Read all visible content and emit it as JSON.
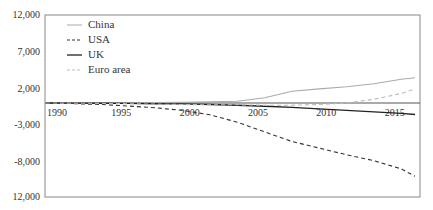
{
  "chart_data": {
    "type": "line",
    "title": "",
    "xlabel": "",
    "ylabel": "",
    "ylim": [
      -12000,
      12000
    ],
    "xlim": [
      1990,
      2017
    ],
    "y_ticks": [
      12000,
      7000,
      2000,
      -3000,
      -8000,
      -12000
    ],
    "y_tick_labels": [
      "12,000",
      "7,000",
      "2,000",
      "-3,000",
      "-8,000",
      "12,000"
    ],
    "x_ticks": [
      1990,
      1995,
      2000,
      2005,
      2010,
      2015
    ],
    "x_tick_labels": [
      "1990",
      "1995",
      "2000",
      "2005",
      "2010",
      "2015"
    ],
    "grid": false,
    "legend_position": "upper-left",
    "x": [
      1990,
      1992,
      1994,
      1996,
      1998,
      2000,
      2002,
      2004,
      2006,
      2008,
      2010,
      2012,
      2014,
      2016,
      2017
    ],
    "series": [
      {
        "name": "China",
        "style": "solid",
        "color": "#aaaaaa",
        "values": [
          0,
          10,
          20,
          40,
          60,
          100,
          150,
          250,
          700,
          1600,
          1900,
          2200,
          2600,
          3200,
          3400
        ]
      },
      {
        "name": "USA",
        "style": "dashed",
        "color": "#333333",
        "values": [
          0,
          -80,
          -200,
          -400,
          -650,
          -1000,
          -1600,
          -2600,
          -3900,
          -5200,
          -6100,
          -7000,
          -7800,
          -8900,
          -9900
        ]
      },
      {
        "name": "UK",
        "style": "solid",
        "color": "#222222",
        "values": [
          0,
          -20,
          -40,
          -60,
          -90,
          -120,
          -200,
          -300,
          -450,
          -600,
          -800,
          -1000,
          -1200,
          -1400,
          -1550
        ]
      },
      {
        "name": "Euro area",
        "style": "dashed",
        "color": "#bbbbbb",
        "values": [
          0,
          -30,
          -60,
          -100,
          -150,
          -200,
          -250,
          -250,
          -300,
          -300,
          -200,
          0,
          500,
          1300,
          1900
        ]
      }
    ]
  },
  "legend": {
    "items": [
      {
        "label": "China"
      },
      {
        "label": "USA"
      },
      {
        "label": "UK"
      },
      {
        "label": "Euro area"
      }
    ]
  }
}
